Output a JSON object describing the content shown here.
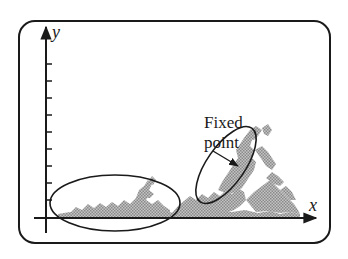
{
  "diagram": {
    "axes": {
      "x_label": "x",
      "y_label": "y",
      "y_tick_count": 9
    },
    "annotation": {
      "line1": "Fixed",
      "line2": "point"
    },
    "regions": [
      {
        "name": "basin-region",
        "shape": "ellipse",
        "description": "large horizontal ellipse near origin along x-axis"
      },
      {
        "name": "fixed-point-region",
        "shape": "ellipse",
        "description": "tilted ellipse around fractal peak"
      }
    ],
    "colors": {
      "stroke": "#1a1a1a",
      "fractal": "#9a9a9a",
      "background": "#ffffff"
    }
  }
}
